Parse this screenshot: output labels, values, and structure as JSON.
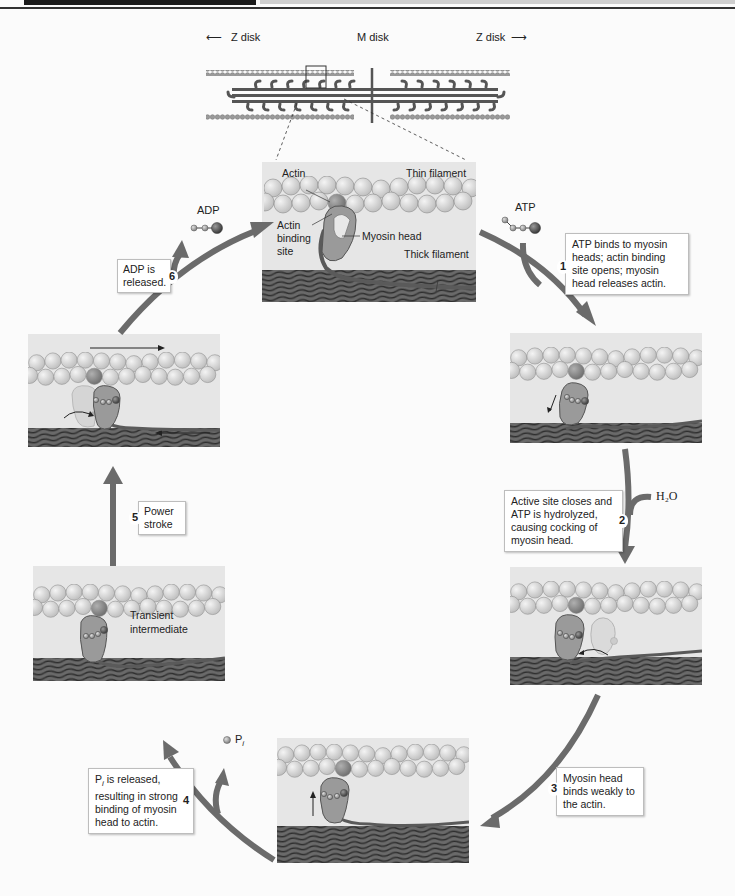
{
  "figure": {
    "title_labels": {
      "z_disk_left": "Z disk",
      "m_disk": "M disk",
      "z_disk_right": "Z disk"
    },
    "top_panel_labels": {
      "actin": "Actin",
      "thin_filament": "Thin filament",
      "actin_binding_site_1": "Actin",
      "actin_binding_site_2": "binding",
      "actin_binding_site_3": "site",
      "myosin_head": "Myosin head",
      "thick_filament": "Thick filament"
    },
    "molecules": {
      "atp": "ATP",
      "adp": "ADP",
      "water": "H₂O",
      "pi_base": "P",
      "pi_sub": "i"
    },
    "steps": [
      {
        "number": "1",
        "lines": [
          "ATP binds to myosin",
          "heads; actin binding",
          "site opens; myosin",
          "head releases actin."
        ]
      },
      {
        "number": "2",
        "lines": [
          "Active site closes and",
          "ATP is hydrolyzed,",
          "causing cocking of",
          "myosin head."
        ]
      },
      {
        "number": "3",
        "lines": [
          "Myosin head",
          "binds weakly to",
          "the actin."
        ]
      },
      {
        "number": "4",
        "lines": [
          "is released,",
          "resulting in strong",
          "binding of myosin",
          "head to actin."
        ],
        "lead_base": "P",
        "lead_sub": "i"
      },
      {
        "number": "5",
        "lines": [
          "Power",
          "stroke"
        ]
      },
      {
        "number": "6",
        "lines": [
          "ADP is",
          "released."
        ]
      }
    ],
    "transient_label": [
      "Transient",
      "intermediate"
    ],
    "colors": {
      "arrow": "#6b6b6b",
      "panel_bg": "#e6e6e6",
      "actin_bead": "#d9d9d9",
      "binding_site_bead": "#8c8c8c",
      "myosin_head": "#9a9a9a",
      "thick_filament": "#4a4a4a"
    }
  }
}
